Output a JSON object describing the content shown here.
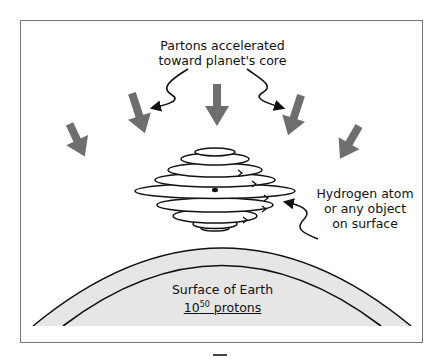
{
  "diagram": {
    "title_label": {
      "line1": "Partons accelerated",
      "line2": "toward planet's core"
    },
    "object_label": {
      "line1": "Hydrogen atom",
      "line2": "or any object",
      "line3": "on surface"
    },
    "earth_label": {
      "line1": "Surface of Earth",
      "count_base": "10",
      "count_exponent": "50",
      "count_unit": " protons"
    },
    "colors": {
      "arrow_fill": "#6e6e6e",
      "earth_fill": "#e6e6e6",
      "line": "#111111",
      "frame": "#777777"
    },
    "elements": [
      {
        "type": "gravity-arrow",
        "count": 6
      },
      {
        "type": "stacked-ellipses",
        "description": "spinning disc layers representing object",
        "count": 9
      },
      {
        "type": "earth-arcs",
        "count": 2
      }
    ]
  }
}
